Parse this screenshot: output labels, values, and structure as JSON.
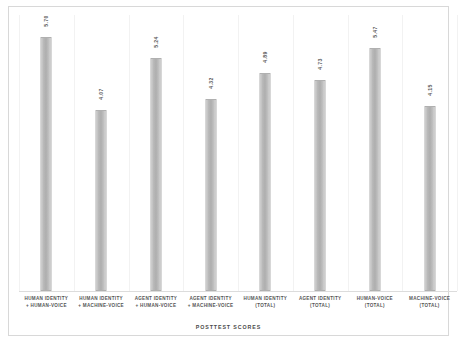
{
  "chart_data": {
    "type": "bar",
    "title": "",
    "subtitle": "",
    "xlabel": "POSTTEST SCORES",
    "ylabel": "",
    "ylim": [
      0,
      6.2
    ],
    "grid": "vertical-faint",
    "legend": "none",
    "categories": [
      "HUMAN IDENTITY + HUMAN-VOICE",
      "HUMAN IDENTITY + MACHINE-VOICE",
      "AGENT IDENTITY + HUMAN-VOICE",
      "AGENT IDENTITY + MACHINE-VOICE",
      "HUMAN IDENTITY (TOTAL)",
      "AGENT IDENTITY (TOTAL)",
      "HUMAN-VOICE (TOTAL)",
      "MACHINE-VOICE (TOTAL)"
    ],
    "category_lines": [
      [
        "HUMAN IDENTITY",
        "+ HUMAN-VOICE"
      ],
      [
        "HUMAN IDENTITY",
        "+ MACHINE-VOICE"
      ],
      [
        "AGENT IDENTITY",
        "+ HUMAN-VOICE"
      ],
      [
        "AGENT IDENTITY",
        "+ MACHINE-VOICE"
      ],
      [
        "HUMAN IDENTITY",
        "(TOTAL)"
      ],
      [
        "AGENT IDENTITY",
        "(TOTAL)"
      ],
      [
        "HUMAN-VOICE",
        "(TOTAL)"
      ],
      [
        "MACHINE-VOICE",
        "(TOTAL)"
      ]
    ],
    "values": [
      5.7,
      4.07,
      5.24,
      4.32,
      4.89,
      4.73,
      5.47,
      4.15
    ],
    "value_labels": [
      "5.70",
      "4.07",
      "5.24",
      "4.32",
      "4.89",
      "4.73",
      "5.47",
      "4.15"
    ],
    "colors": {
      "bar_fill": "#bcbcbc",
      "bar_border": "#b0b0b0",
      "frame_border": "#d8d8d8",
      "gridline": "#f2f2f2",
      "text": "#555555",
      "background": "#ffffff"
    }
  }
}
